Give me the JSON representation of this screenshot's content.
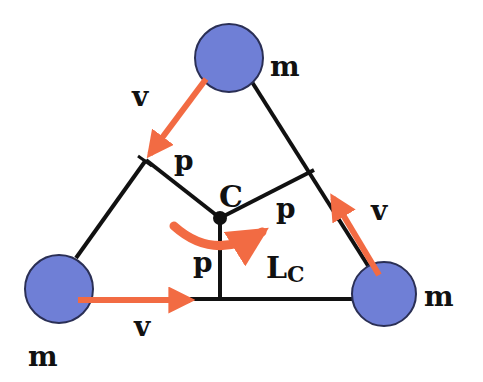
{
  "figure": {
    "colors": {
      "mass_fill": "#6f7fd6",
      "mass_stroke": "#2a2f55",
      "arrow": "#f26b43",
      "line": "#111111"
    },
    "masses": [
      {
        "id": "top",
        "label": "m"
      },
      {
        "id": "bottom-left",
        "label": "m"
      },
      {
        "id": "bottom-right",
        "label": "m"
      }
    ],
    "velocity_labels": [
      "v",
      "v",
      "v"
    ],
    "lever_arm_labels": [
      "p",
      "p",
      "p"
    ],
    "center_label": "C",
    "angular_momentum": {
      "symbol": "L",
      "subscript": "C"
    }
  }
}
